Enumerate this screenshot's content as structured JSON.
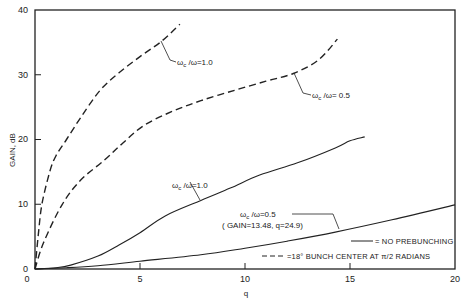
{
  "chart_data": {
    "type": "line",
    "title": "",
    "xlabel": "q",
    "ylabel": "GAIN, dB",
    "xlim": [
      0,
      20
    ],
    "ylim": [
      0,
      40
    ],
    "xticks": [
      0,
      5,
      10,
      15,
      20
    ],
    "yticks": [
      0,
      10,
      20,
      30,
      40
    ],
    "grid": false,
    "legend_position": "lower right",
    "legend": [
      {
        "style": "solid",
        "label": "= NO PREBUNCHING"
      },
      {
        "style": "dashed",
        "label": "=18° BUNCH CENTER AT π/2 RADIANS"
      }
    ],
    "series": [
      {
        "name": "ωc/ω=1.0, 18° bunch (dashed)",
        "style": "dashed",
        "x": [
          0,
          0.15,
          0.33,
          0.7,
          1.0,
          1.5,
          2.2,
          3.1,
          4.0,
          5.0,
          6.0,
          6.9
        ],
        "y": [
          0,
          5,
          10,
          15,
          17.5,
          20,
          23.5,
          27.6,
          30.3,
          32.8,
          35.1,
          37.8
        ]
      },
      {
        "name": "ωc/ω=0.5, 18° bunch (dashed)",
        "style": "dashed",
        "x": [
          0,
          0.4,
          1.3,
          2.2,
          3.3,
          4.2,
          5.2,
          6.5,
          7.9,
          9.5,
          11.0,
          12.3,
          13.5,
          14.4
        ],
        "y": [
          0,
          4,
          10,
          13.8,
          16.8,
          19.5,
          22.2,
          24.3,
          26.0,
          27.6,
          29.0,
          30.2,
          32.3,
          35.5
        ]
      },
      {
        "name": "ωc/ω=1.0, no prebunching (solid)",
        "style": "solid",
        "x": [
          0,
          1.0,
          1.7,
          3.0,
          4.0,
          5.0,
          6.2,
          7.9,
          9.3,
          10.7,
          12.5,
          14.3,
          15.0,
          15.7
        ],
        "y": [
          0,
          0.2,
          0.6,
          2.0,
          3.7,
          5.6,
          8.2,
          10.6,
          12.5,
          14.5,
          16.4,
          18.7,
          19.8,
          20.4
        ]
      },
      {
        "name": "ωc/ω=0.5, no prebunching (solid)",
        "style": "solid",
        "x": [
          0,
          1.5,
          3.0,
          5.0,
          7.9,
          10.0,
          12.0,
          14.3,
          17.0,
          20.0
        ],
        "y": [
          0,
          0.2,
          0.5,
          1.2,
          2.2,
          3.2,
          4.3,
          5.7,
          7.6,
          9.9
        ]
      }
    ],
    "annotations": [
      {
        "text_main": "ω",
        "sub": "c",
        "text_rest": " /ω=1.0",
        "points_to": "dashed ωc/ω=1.0 at q≈6"
      },
      {
        "text_main": "ω",
        "sub": "c",
        "text_rest": " /ω= 0.5",
        "points_to": "dashed ωc/ω=0.5 at q≈12.3"
      },
      {
        "text_main": "ω",
        "sub": "c",
        "text_rest": " /ω=1.0",
        "points_to": "solid ωc/ω=1.0 at q≈7.9"
      },
      {
        "text_main": "ω",
        "sub": "c",
        "text_rest": " /ω=0.5",
        "note": "( GAIN=13.48, q=24.9)",
        "points_to": "solid ωc/ω=0.5"
      }
    ]
  },
  "labels": {
    "ylabel": "GAIN, dB",
    "xlabel": "q",
    "xticks": [
      "0",
      "5",
      "10",
      "15",
      "20"
    ],
    "yticks": [
      "0",
      "10",
      "20",
      "30",
      "40"
    ],
    "ann1_rest": " /ω=1.0",
    "ann2_rest": " /ω= 0.5",
    "ann3_rest": " /ω=1.0",
    "ann4_rest": " /ω=0.5",
    "ann4_note": "( GAIN=13.48, q=24.9)",
    "omega": "ω",
    "sub_c": "c",
    "legend_solid": "= NO PREBUNCHING",
    "legend_dashed": "=18° BUNCH CENTER  AT  π/2 RADIANS"
  }
}
